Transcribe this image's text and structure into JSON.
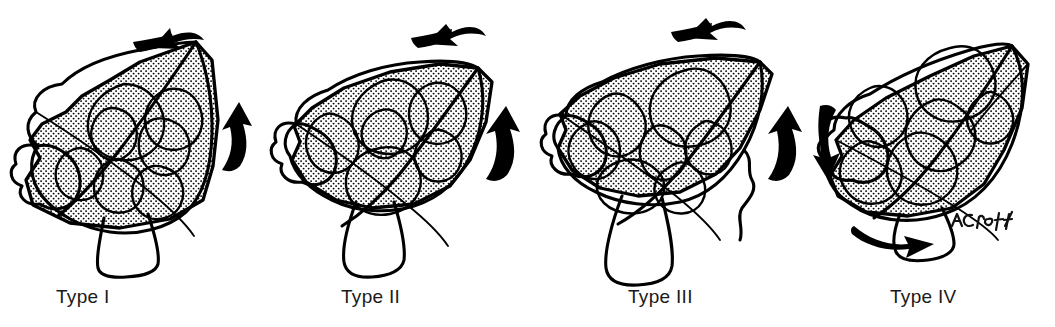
{
  "figure": {
    "background_color": "#ffffff",
    "ink_color": "#000000",
    "label_color": "#1a1a1a",
    "signature": "ACroft"
  },
  "panels": [
    {
      "id": "type-1",
      "label": "Type I",
      "label_x": 56,
      "caption_align": "left",
      "rotation_state": "least rotated",
      "stipple_overlay": true,
      "arrows": [
        "top-curved-left"
      ]
    },
    {
      "id": "type-2",
      "label": "Type II",
      "label_x": 341,
      "caption_align": "left",
      "rotation_state": "mildly rotated",
      "stipple_overlay": true,
      "arrows": [
        "top-curved-left"
      ]
    },
    {
      "id": "type-3",
      "label": "Type III",
      "label_x": 628,
      "caption_align": "left",
      "rotation_state": "moderately rotated",
      "stipple_overlay": true,
      "arrows": [
        "top-curved-left"
      ]
    },
    {
      "id": "type-4",
      "label": "Type IV",
      "label_x": 890,
      "caption_align": "left",
      "rotation_state": "fully rotated",
      "stipple_overlay": true,
      "arrows": [
        "bottom-curved-right"
      ]
    }
  ],
  "connector_arrows": [
    {
      "id": "arrow-1-2",
      "direction": "up",
      "between": "Type I / Type II",
      "x": 228,
      "y": 100
    },
    {
      "id": "arrow-2-3",
      "direction": "up",
      "between": "Type II / Type III",
      "x": 496,
      "y": 105
    },
    {
      "id": "arrow-3-4",
      "direction": "up",
      "between": "Type III / Type IV",
      "x": 778,
      "y": 105
    },
    {
      "id": "arrow-4-3",
      "direction": "down",
      "between": "Type III / Type IV",
      "x": 818,
      "y": 105
    }
  ],
  "top_arrows": [
    {
      "id": "top-arrow-1",
      "direction": "left",
      "above": "Type I",
      "x": 92,
      "y": 22
    },
    {
      "id": "top-arrow-2",
      "direction": "left",
      "above": "Type II",
      "x": 388,
      "y": 14
    },
    {
      "id": "top-arrow-3",
      "direction": "left",
      "above": "Type III",
      "x": 648,
      "y": 8
    }
  ],
  "bottom_arrows": [
    {
      "id": "bottom-arrow-4",
      "direction": "right",
      "below": "Type IV",
      "x": 852,
      "y": 222
    }
  ]
}
